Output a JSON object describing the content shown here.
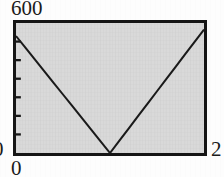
{
  "chart_data": {
    "type": "line",
    "title": "",
    "xlabel": "",
    "ylabel": "",
    "xlim": [
      0,
      2
    ],
    "ylim": [
      0,
      600
    ],
    "grid": false,
    "legend": null,
    "x_tick_labels": [
      "0",
      "2"
    ],
    "y_tick_labels": [
      "0",
      "600"
    ],
    "y_minor_tick_count": 6,
    "annotations": [],
    "series": [
      {
        "name": "v-curve",
        "style": "solid",
        "color": "#1a1a1a",
        "x": [
          0.0,
          0.1,
          0.2,
          0.3,
          0.4,
          0.5,
          0.6,
          0.7,
          0.8,
          0.9,
          1.0,
          1.1,
          1.2,
          1.3,
          1.4,
          1.5,
          1.6,
          1.7,
          1.8,
          1.9,
          2.0
        ],
        "values": [
          540,
          486,
          432,
          378,
          324,
          270,
          216,
          162,
          108,
          54,
          0,
          57,
          114,
          171,
          228,
          285,
          342,
          399,
          456,
          513,
          570
        ]
      }
    ]
  },
  "labels": {
    "y_max": "600",
    "y_min": "0",
    "x_min": "0",
    "x_max": "2"
  },
  "colors": {
    "panel_background": "#d9d9d9",
    "frame": "#151515",
    "line": "#1a1a1a",
    "text": "#1b1b1b",
    "page_background": "#fdfdfd"
  }
}
